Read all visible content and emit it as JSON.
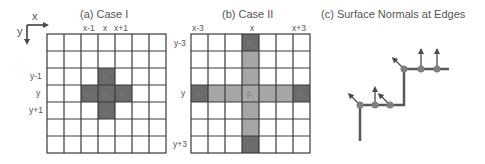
{
  "axes": {
    "x_label": "x",
    "y_label": "y"
  },
  "panels": [
    {
      "title": "(a) Case I",
      "col_labels": [
        "x-1",
        "x",
        "x+1"
      ],
      "row_labels": [
        "y-1",
        "y",
        "y+1"
      ],
      "grid": {
        "rows": 7,
        "cols": 7
      },
      "cells": [
        {
          "row": 2,
          "col": 3,
          "label": "p1",
          "shade": "dark"
        },
        {
          "row": 3,
          "col": 2,
          "label": "p4",
          "shade": "dark"
        },
        {
          "row": 3,
          "col": 3,
          "label": "p0",
          "shade": "dark"
        },
        {
          "row": 3,
          "col": 4,
          "label": "p2",
          "shade": "dark"
        },
        {
          "row": 4,
          "col": 3,
          "label": "p3",
          "shade": "dark"
        }
      ]
    },
    {
      "title": "(b) Case II",
      "col_labels": [
        "x-3",
        "x",
        "x+3"
      ],
      "row_labels": [
        "y-3",
        "y",
        "y+3"
      ],
      "grid": {
        "rows": 7,
        "cols": 7
      },
      "cells": [
        {
          "row": 0,
          "col": 3,
          "label": "p5",
          "shade": "dark"
        },
        {
          "row": 3,
          "col": 0,
          "label": "p8",
          "shade": "dark"
        },
        {
          "row": 3,
          "col": 3,
          "label": "pc",
          "shade": "light"
        },
        {
          "row": 3,
          "col": 6,
          "label": "p6",
          "shade": "dark"
        },
        {
          "row": 6,
          "col": 3,
          "label": "p7",
          "shade": "dark"
        }
      ]
    },
    {
      "title": "(c) Surface Normals at Edges"
    }
  ],
  "colors": {
    "grid_line": "#3a3a3a",
    "dark_cell": "#6b6b6b",
    "light_cell": "#a6a6a6",
    "edge_line": "#595959",
    "node": "#808080"
  }
}
